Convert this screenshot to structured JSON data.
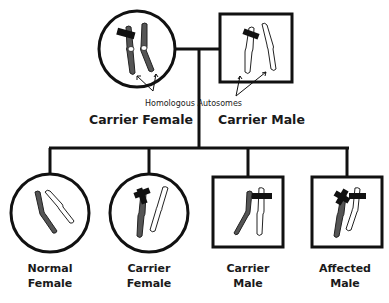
{
  "diagram": {
    "type": "pedigree",
    "annotation": "Homologous Autosomes",
    "parents": [
      {
        "id": "mother",
        "symbol": "circle",
        "label": "Carrier Female",
        "chromosomes": [
          "dark-with-band",
          "dark"
        ]
      },
      {
        "id": "father",
        "symbol": "square",
        "label": "Carrier Male",
        "chromosomes": [
          "light-with-band",
          "light"
        ]
      }
    ],
    "children": [
      {
        "id": "child1",
        "symbol": "circle",
        "label_line1": "Normal",
        "label_line2": "Female",
        "chromosomes": [
          "dark",
          "light"
        ]
      },
      {
        "id": "child2",
        "symbol": "circle",
        "label_line1": "Carrier",
        "label_line2": "Female",
        "chromosomes": [
          "dark-with-band",
          "light"
        ]
      },
      {
        "id": "child3",
        "symbol": "square",
        "label_line1": "Carrier",
        "label_line2": "Male",
        "chromosomes": [
          "dark",
          "light-with-band"
        ]
      },
      {
        "id": "child4",
        "symbol": "square",
        "label_line1": "Affected",
        "label_line2": "Male",
        "chromosomes": [
          "dark-with-band",
          "light-with-band"
        ]
      }
    ],
    "colors": {
      "line": "#111111",
      "dark_chromosome": "#555555",
      "light_chromosome": "#ffffff",
      "background": "#ffffff"
    }
  }
}
